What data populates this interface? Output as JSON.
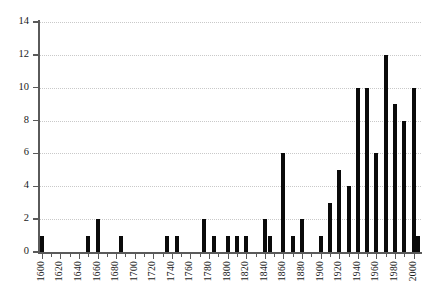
{
  "chart_data": {
    "type": "bar",
    "title": "",
    "subtitle": "",
    "xlabel": "",
    "ylabel": "",
    "xlim": [
      1597,
      2008
    ],
    "ylim": [
      0,
      14
    ],
    "grid": true,
    "legend": null,
    "bar_color": "#0a0a0a",
    "gridline_color": "#c9c9c9",
    "axis_color": "#5a5a5a",
    "y_ticks": [
      0,
      2,
      4,
      6,
      8,
      10,
      12,
      14
    ],
    "x_ticks": [
      1600,
      1620,
      1640,
      1660,
      1680,
      1700,
      1720,
      1740,
      1760,
      1780,
      1800,
      1820,
      1840,
      1860,
      1880,
      1900,
      1920,
      1940,
      1960,
      1980,
      2000
    ],
    "x_tick_labels": [
      "1600",
      "1620",
      "1640",
      "1660",
      "1680",
      "1700",
      "1720",
      "1740",
      "1760",
      "1780",
      "1800",
      "1820",
      "1840",
      "1860",
      "1880",
      "1900",
      "1920",
      "1940",
      "1960",
      "1980",
      "2000"
    ],
    "y_tick_labels": [
      "0",
      "2",
      "4",
      "6",
      "8",
      "10",
      "12",
      "14"
    ],
    "bin_width": 5,
    "categories": [
      1600,
      1605,
      1610,
      1615,
      1620,
      1625,
      1630,
      1635,
      1640,
      1645,
      1650,
      1655,
      1660,
      1665,
      1670,
      1675,
      1680,
      1685,
      1690,
      1695,
      1700,
      1705,
      1710,
      1715,
      1720,
      1725,
      1730,
      1735,
      1740,
      1745,
      1750,
      1755,
      1760,
      1765,
      1770,
      1775,
      1780,
      1785,
      1790,
      1795,
      1800,
      1805,
      1810,
      1815,
      1820,
      1825,
      1830,
      1835,
      1840,
      1845,
      1850,
      1855,
      1860,
      1865,
      1870,
      1875,
      1880,
      1885,
      1890,
      1895,
      1900,
      1905,
      1910,
      1915,
      1920,
      1925,
      1930,
      1935,
      1940,
      1945,
      1950,
      1955,
      1960,
      1965,
      1970,
      1975,
      1980,
      1985,
      1990,
      1995,
      2000,
      2005
    ],
    "values": [
      1,
      0,
      0,
      0,
      0,
      0,
      0,
      0,
      0,
      0,
      1,
      0,
      2,
      0,
      0,
      0,
      0,
      1,
      0,
      0,
      0,
      0,
      0,
      0,
      0,
      0,
      0,
      1,
      0,
      1,
      0,
      0,
      0,
      0,
      0,
      2,
      0,
      1,
      0,
      0,
      1,
      0,
      1,
      0,
      1,
      0,
      0,
      0,
      2,
      1,
      0,
      0,
      6,
      0,
      1,
      0,
      2,
      0,
      0,
      0,
      1,
      0,
      3,
      0,
      5,
      0,
      4,
      0,
      10,
      0,
      10,
      0,
      6,
      0,
      12,
      0,
      9,
      0,
      8,
      0,
      10,
      1
    ]
  },
  "axes": {
    "y_axis_name": "y-axis",
    "x_axis_name": "x-axis"
  }
}
